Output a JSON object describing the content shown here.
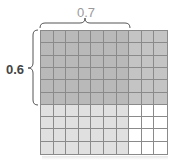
{
  "labels": {
    "top_value": "0.7",
    "left_value": "0.6"
  },
  "grid": {
    "rows": 10,
    "columns": 10,
    "shaded_rows": 6,
    "shaded_columns": 7
  },
  "colors": {
    "overlap": "#b9b9b9",
    "rows_only": "#c4c4c4",
    "columns_only": "#e0e0e0",
    "empty": "#ffffff",
    "grid_line": "#8a8a8a",
    "top_label": "#9a9a9a",
    "left_label": "#444444"
  }
}
